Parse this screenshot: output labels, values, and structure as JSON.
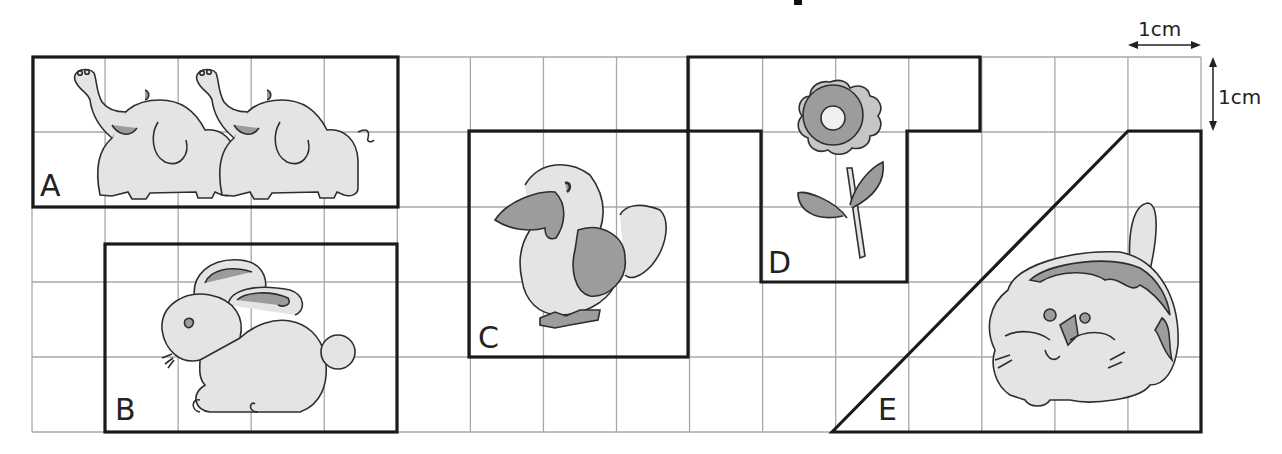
{
  "title": {
    "visible_fragment": true
  },
  "grid": {
    "columns": 16,
    "rows": 5,
    "left": 32,
    "top": 57,
    "right": 1201,
    "bottom": 432,
    "line_color": "#a8a8a8",
    "outline_color": "#1a1a1a"
  },
  "scale": {
    "horizontal_label": "1cm",
    "vertical_label": "1cm"
  },
  "shapes": [
    {
      "id": "A",
      "label": "A",
      "picture": "two elephants",
      "cells": "rectangle 5×2 cm"
    },
    {
      "id": "B",
      "label": "B",
      "picture": "rabbit",
      "cells": "rectangle 4×2.5 cm"
    },
    {
      "id": "C",
      "label": "C",
      "picture": "bird",
      "cells": "square 3×3 cm"
    },
    {
      "id": "D",
      "label": "D",
      "picture": "flower",
      "cells": "T-shape"
    },
    {
      "id": "E",
      "label": "E",
      "picture": "tiger cub",
      "cells": "trapezoid"
    }
  ],
  "colors": {
    "fill_light": "#e4e4e4",
    "fill_dark": "#9c9c9c",
    "stroke": "#2e2e2e"
  }
}
